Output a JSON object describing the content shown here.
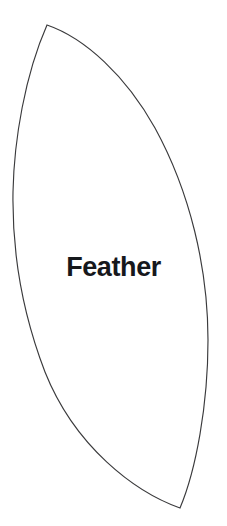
{
  "canvas": {
    "width": 227,
    "height": 526,
    "background_color": "#ffffff"
  },
  "shape": {
    "name": "feather-template-outline",
    "kind": "lens",
    "label": "Feather",
    "outline_color": "#3a3a3c",
    "fill_color": "#ffffff",
    "stroke_width": 1.15,
    "top_tip": {
      "x": 47,
      "y": 25
    },
    "bottom_tip": {
      "x": 180,
      "y": 508
    },
    "left_extreme": {
      "x": 13,
      "y": 190
    },
    "right_extreme": {
      "x": 208,
      "y": 340
    },
    "path": "M47,25 C25,75 14,140 13,192 C12,250 22,312 45,372 C75,447 135,492 180,508 C196,470 208,405 208,340 C208,268 190,192 155,128 C126,76 85,38 47,25 Z"
  },
  "label": {
    "text": "Feather",
    "color": "#16181c",
    "font_size_px": 27,
    "weight": "bold",
    "center": {
      "x": 111,
      "y": 268
    }
  }
}
